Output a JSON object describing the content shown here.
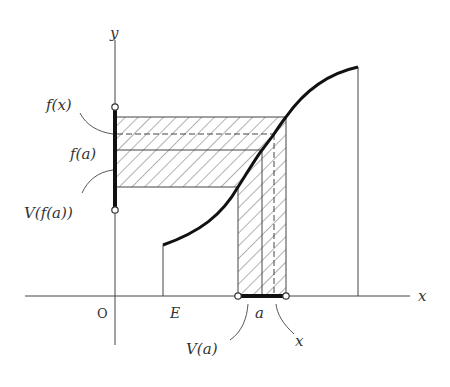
{
  "figure": {
    "axes": {
      "x_label": "x",
      "y_label": "y",
      "origin_label": "O"
    },
    "domain_label": "E",
    "point_labels": {
      "a": "a",
      "x": "x",
      "V_a": "V(a)",
      "f_x": "f(x)",
      "f_a": "f(a)",
      "V_f_a": "V(f(a))"
    },
    "colors": {
      "ink": "#333333",
      "background": "#ffffff"
    }
  }
}
